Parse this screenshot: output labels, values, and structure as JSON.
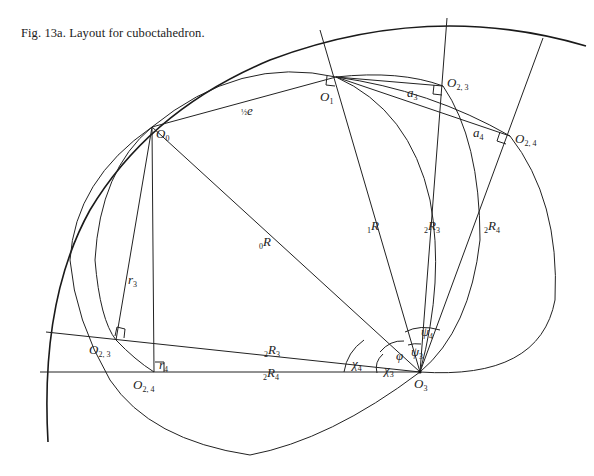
{
  "caption": "Fig. 13a.  Layout for cuboctahedron.",
  "points": {
    "O0": {
      "main": "O",
      "sub": "0"
    },
    "O1": {
      "main": "O",
      "sub": "1"
    },
    "O23_upper": {
      "main": "O",
      "sub": "2, 3"
    },
    "O24_upper": {
      "main": "O",
      "sub": "2, 4"
    },
    "O23_lower": {
      "main": "O",
      "sub": "2, 3"
    },
    "O24_lower": {
      "main": "O",
      "sub": "2, 4"
    },
    "O3": {
      "main": "O",
      "sub": "3"
    }
  },
  "segments": {
    "half_e": {
      "frac": "½",
      "main": "e"
    },
    "a3": {
      "main": "a",
      "sub": "3"
    },
    "a4": {
      "main": "a",
      "sub": "4"
    },
    "r3": {
      "main": "r",
      "sub": "3"
    },
    "r4": {
      "main": "r",
      "sub": "4"
    },
    "R0": {
      "pre": "0",
      "main": "R"
    },
    "R1": {
      "pre": "1",
      "main": "R"
    },
    "R23_upper": {
      "pre": "2",
      "main": "R",
      "sub": "3"
    },
    "R24_upper": {
      "pre": "2",
      "main": "R",
      "sub": "4"
    },
    "R23_lower": {
      "pre": "2",
      "main": "R",
      "sub": "3"
    },
    "R24_lower": {
      "pre": "2",
      "main": "R",
      "sub": "4"
    }
  },
  "angles": {
    "phi": {
      "main": "φ"
    },
    "psi3": {
      "main": "ψ",
      "sub": "3"
    },
    "psi4": {
      "main": "ψ",
      "sub": "4"
    },
    "chi3": {
      "main": "χ",
      "sub": "3"
    },
    "chi4": {
      "main": "χ",
      "sub": "4"
    }
  }
}
